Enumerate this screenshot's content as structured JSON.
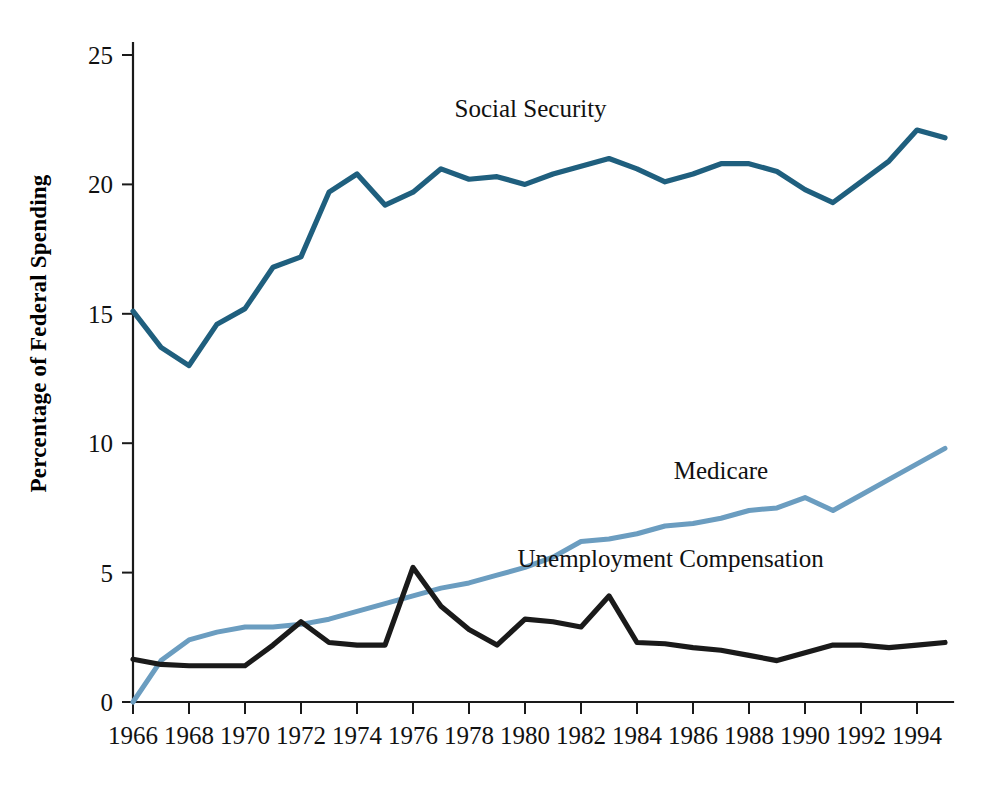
{
  "chart_data": {
    "type": "line",
    "title": "",
    "xlabel": "",
    "ylabel": "Percentage of Federal Spending",
    "xlim": [
      1966,
      1995
    ],
    "ylim": [
      0,
      25
    ],
    "grid": false,
    "legend_position": "inline-annotations",
    "x_tick_labels": [
      "1966",
      "1968",
      "1970",
      "1972",
      "1974",
      "1976",
      "1978",
      "1980",
      "1982",
      "1984",
      "1986",
      "1988",
      "1990",
      "1992",
      "1994"
    ],
    "x_ticks": [
      1966,
      1968,
      1970,
      1972,
      1974,
      1976,
      1978,
      1980,
      1982,
      1984,
      1986,
      1988,
      1990,
      1992,
      1994
    ],
    "y_tick_labels": [
      "0",
      "5",
      "10",
      "15",
      "20",
      "25"
    ],
    "y_ticks": [
      0,
      5,
      10,
      15,
      20,
      25
    ],
    "x": [
      1966,
      1967,
      1968,
      1969,
      1970,
      1971,
      1972,
      1973,
      1974,
      1975,
      1976,
      1977,
      1978,
      1979,
      1980,
      1981,
      1982,
      1983,
      1984,
      1985,
      1986,
      1987,
      1988,
      1989,
      1990,
      1991,
      1992,
      1993,
      1994,
      1995
    ],
    "series": [
      {
        "name": "Social Security",
        "color": "#1f5f7e",
        "label_x": 1980.2,
        "label_y": 22.6,
        "values": [
          15.1,
          13.7,
          13.0,
          14.6,
          15.2,
          16.8,
          17.2,
          19.7,
          20.4,
          19.2,
          19.7,
          20.6,
          20.2,
          20.3,
          20.0,
          20.4,
          20.7,
          21.0,
          20.6,
          20.1,
          20.4,
          20.8,
          20.8,
          20.5,
          19.8,
          19.3,
          20.1,
          20.9,
          22.1,
          21.8
        ]
      },
      {
        "name": "Medicare",
        "color": "#6b9dc0",
        "label_x": 1987.0,
        "label_y": 8.6,
        "values": [
          0.0,
          1.6,
          2.4,
          2.7,
          2.9,
          2.9,
          3.0,
          3.2,
          3.5,
          3.8,
          4.1,
          4.4,
          4.6,
          4.9,
          5.2,
          5.6,
          6.2,
          6.3,
          6.5,
          6.8,
          6.9,
          7.1,
          7.4,
          7.5,
          7.9,
          7.4,
          8.0,
          8.6,
          9.2,
          9.8
        ]
      },
      {
        "name": "Unemployment Compensation",
        "color": "#1a1a1a",
        "label_x": 1985.2,
        "label_y": 5.2,
        "values": [
          1.65,
          1.45,
          1.4,
          1.4,
          1.4,
          2.2,
          3.1,
          2.3,
          2.2,
          2.2,
          5.2,
          3.7,
          2.8,
          2.2,
          3.2,
          3.1,
          2.9,
          4.1,
          2.3,
          2.25,
          2.1,
          2.0,
          1.8,
          1.6,
          1.9,
          2.2,
          2.2,
          2.1,
          2.2,
          2.3
        ]
      }
    ]
  },
  "plot_geometry": {
    "left": 133,
    "right": 945,
    "top": 55,
    "bottom": 702
  }
}
